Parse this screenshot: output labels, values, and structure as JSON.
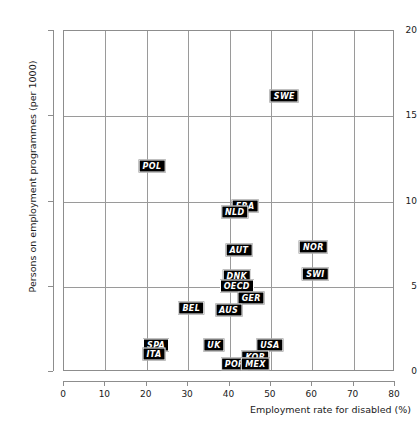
{
  "chart_data": {
    "type": "scatter",
    "title": "",
    "xlabel": "Employment rate for disabled (%)",
    "ylabel": "Persons on employment programmes (per 1000)",
    "xlim": [
      0,
      80
    ],
    "ylim": [
      0,
      20
    ],
    "xticks": [
      "0",
      "10",
      "20",
      "30",
      "40",
      "50",
      "60",
      "70",
      "80"
    ],
    "yticks": [
      "0",
      "5",
      "10",
      "15",
      "20"
    ],
    "grid": true,
    "legend": "none",
    "point_style": "black-box-label",
    "points": [
      {
        "label": "SWE",
        "x": 53.5,
        "y": 16.1
      },
      {
        "label": "POL",
        "x": 21.5,
        "y": 12.0
      },
      {
        "label": "FRA",
        "x": 44.0,
        "y": 9.7
      },
      {
        "label": "NLD",
        "x": 41.5,
        "y": 9.3
      },
      {
        "label": "NOR",
        "x": 60.5,
        "y": 7.3
      },
      {
        "label": "AUT",
        "x": 42.5,
        "y": 7.1
      },
      {
        "label": "SWI",
        "x": 61.0,
        "y": 5.7
      },
      {
        "label": "DNK",
        "x": 42.0,
        "y": 5.6
      },
      {
        "label": "OECD",
        "x": 42.0,
        "y": 5.0
      },
      {
        "label": "GER",
        "x": 45.5,
        "y": 4.3
      },
      {
        "label": "BEL",
        "x": 31.0,
        "y": 3.7
      },
      {
        "label": "AUS",
        "x": 40.0,
        "y": 3.6
      },
      {
        "label": "USA",
        "x": 50.0,
        "y": 1.5
      },
      {
        "label": "UK",
        "x": 36.5,
        "y": 1.5
      },
      {
        "label": "SPA",
        "x": 22.5,
        "y": 1.5
      },
      {
        "label": "ITA",
        "x": 22.0,
        "y": 1.0
      },
      {
        "label": "KOR",
        "x": 46.5,
        "y": 0.8
      },
      {
        "label": "POR",
        "x": 41.5,
        "y": 0.4
      },
      {
        "label": "MEX",
        "x": 46.5,
        "y": 0.4
      }
    ]
  }
}
